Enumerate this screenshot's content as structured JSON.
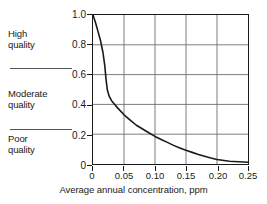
{
  "chart_data": {
    "type": "line",
    "title": "",
    "subtitle": "",
    "xlabel": "Average annual concentration, ppm",
    "ylabel": "",
    "xlim": [
      0,
      0.25
    ],
    "ylim": [
      0,
      1.0
    ],
    "grid": true,
    "legend": null,
    "x_ticks": [
      "0",
      "0.05",
      "0.10",
      "0.15",
      "0.20",
      "0.25"
    ],
    "x_tick_values": [
      0,
      0.05,
      0.1,
      0.15,
      0.2,
      0.25
    ],
    "y_ticks": [
      "0",
      "0.2",
      "0.4",
      "0.6",
      "0.8",
      "1.0"
    ],
    "y_tick_values": [
      0,
      0.2,
      0.4,
      0.6,
      0.8,
      1.0
    ],
    "series": [
      {
        "name": "quality index",
        "x": [
          0,
          0.004,
          0.008,
          0.012,
          0.016,
          0.019,
          0.021,
          0.023,
          0.026,
          0.03,
          0.035,
          0.04,
          0.05,
          0.06,
          0.07,
          0.08,
          0.09,
          0.1,
          0.11,
          0.12,
          0.13,
          0.14,
          0.15,
          0.16,
          0.17,
          0.18,
          0.19,
          0.2,
          0.22,
          0.25
        ],
        "y": [
          1.0,
          0.95,
          0.89,
          0.83,
          0.75,
          0.66,
          0.57,
          0.5,
          0.455,
          0.425,
          0.4,
          0.375,
          0.33,
          0.295,
          0.26,
          0.235,
          0.21,
          0.185,
          0.165,
          0.145,
          0.125,
          0.108,
          0.092,
          0.078,
          0.064,
          0.052,
          0.04,
          0.03,
          0.018,
          0.012
        ]
      }
    ],
    "annotations": [
      {
        "id": "high",
        "label": "High\nquality",
        "band": [
          0.6,
          1.0
        ]
      },
      {
        "id": "moderate",
        "label": "Moderate\nquality",
        "band": [
          0.2,
          0.6
        ]
      },
      {
        "id": "poor",
        "label": "Poor\nquality",
        "band": [
          0.0,
          0.2
        ]
      }
    ],
    "divider_values": [
      0.6,
      0.2
    ],
    "colors": {
      "curve": "#1a1a1a",
      "grid": "#6e6e6e",
      "frame": "#1a1a1a",
      "text": "#1a1a1a",
      "background": "#ffffff"
    }
  },
  "axis": {
    "x_title": "Average annual concentration, ppm"
  },
  "quality_bands": {
    "high": "High\nquality",
    "moderate": "Moderate\nquality",
    "poor": "Poor\nquality"
  },
  "ticks": {
    "y": {
      "t0": "0",
      "t1": "0.2",
      "t2": "0.4",
      "t3": "0.6",
      "t4": "0.8",
      "t5": "1.0"
    },
    "x": {
      "t0": "0",
      "t1": "0.05",
      "t2": "0.10",
      "t3": "0.15",
      "t4": "0.20",
      "t5": "0.25"
    }
  }
}
